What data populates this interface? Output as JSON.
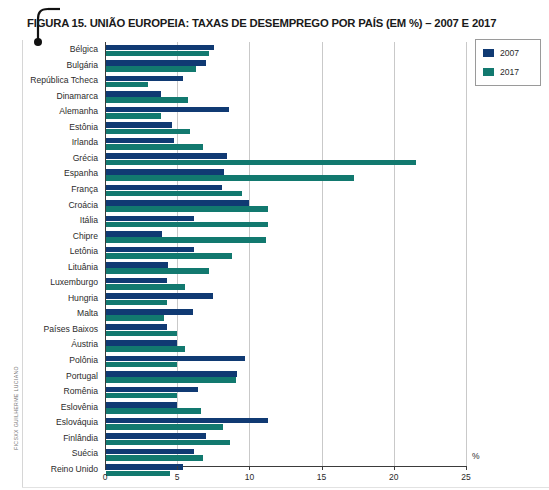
{
  "figure": {
    "title": "FIGURA 15. UNIÃO EUROPEIA: TAXAS DE DESEMPREGO POR PAÍS (EM %) – 2007 E 2017",
    "photo_credit": "FICSXX GUILHERME LUCIANO"
  },
  "legend": {
    "position": "top-right",
    "items": [
      {
        "label": "2007",
        "color": "#103a73"
      },
      {
        "label": "2017",
        "color": "#12796f"
      }
    ]
  },
  "axis": {
    "unit_label": "%",
    "tick_labels": [
      "0",
      "5",
      "10",
      "15",
      "20",
      "25"
    ]
  },
  "chart_data": {
    "type": "bar",
    "orientation": "horizontal",
    "title": "FIGURA 15. UNIÃO EUROPEIA: TAXAS DE DESEMPREGO POR PAÍS (EM %) – 2007 E 2017",
    "xlabel": "%",
    "ylabel": "",
    "xlim": [
      0,
      25
    ],
    "xticks": [
      0,
      5,
      10,
      15,
      20,
      25
    ],
    "grid": true,
    "legend_position": "top-right",
    "categories": [
      "Bélgica",
      "Bulgária",
      "República Tcheca",
      "Dinamarca",
      "Alemanha",
      "Estônia",
      "Irlanda",
      "Grécia",
      "Espanha",
      "França",
      "Croácia",
      "Itália",
      "Chipre",
      "Letônia",
      "Lituânia",
      "Luxemburgo",
      "Hungria",
      "Malta",
      "Países Baixos",
      "Áustria",
      "Polônia",
      "Portugal",
      "Romênia",
      "Eslovênia",
      "Eslováquia",
      "Finlândia",
      "Suécia",
      "Reino Unido"
    ],
    "series": [
      {
        "name": "2007",
        "color": "#103a73",
        "values": [
          7.5,
          6.9,
          5.3,
          3.8,
          8.5,
          4.6,
          4.7,
          8.4,
          8.2,
          8.0,
          9.9,
          6.1,
          3.9,
          6.1,
          4.3,
          4.2,
          7.4,
          6.0,
          4.2,
          4.9,
          9.6,
          9.1,
          6.4,
          4.9,
          11.2,
          6.9,
          6.1,
          5.3
        ]
      },
      {
        "name": "2017",
        "color": "#12796f",
        "values": [
          7.1,
          6.2,
          2.9,
          5.7,
          3.8,
          5.8,
          6.7,
          21.5,
          17.2,
          9.4,
          11.2,
          11.2,
          11.1,
          8.7,
          7.1,
          5.5,
          4.2,
          4.0,
          4.9,
          5.5,
          4.9,
          9.0,
          4.9,
          6.6,
          8.1,
          8.6,
          6.7,
          4.4
        ]
      }
    ]
  }
}
